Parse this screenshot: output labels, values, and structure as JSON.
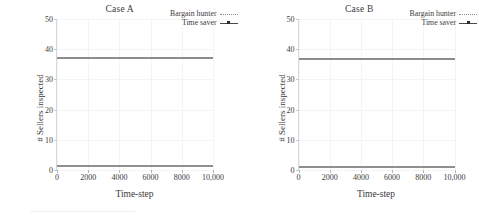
{
  "chart_data": [
    {
      "type": "line",
      "title": "Case A",
      "xlabel": "Time-step",
      "ylabel": "# Sellers inspected",
      "xlim": [
        0,
        10000
      ],
      "ylim": [
        0,
        50
      ],
      "xticks": [
        "0",
        "2000",
        "4000",
        "6000",
        "8000",
        "10,000"
      ],
      "xtick_values": [
        0,
        2000,
        4000,
        6000,
        8000,
        10000
      ],
      "yticks": [
        "0",
        "10",
        "20",
        "30",
        "40",
        "50"
      ],
      "ytick_values": [
        0,
        10,
        20,
        30,
        40,
        50
      ],
      "grid": true,
      "legend_position": "upper right",
      "x": [
        0,
        2000,
        4000,
        6000,
        8000,
        10000
      ],
      "series": [
        {
          "name": "Bargain hunter",
          "style": "dotted",
          "color": "#8f8f8f",
          "values": [
            1.5,
            1.5,
            1.5,
            1.5,
            1.5,
            1.5
          ]
        },
        {
          "name": "Time saver",
          "style": "solid-marker",
          "color": "#8c8c8c",
          "values": [
            37.5,
            37.5,
            37.5,
            37.5,
            37.5,
            37.5
          ]
        }
      ]
    },
    {
      "type": "line",
      "title": "Case B",
      "xlabel": "Time-step",
      "ylabel": "# Sellers inspected",
      "xlim": [
        0,
        10000
      ],
      "ylim": [
        0,
        50
      ],
      "xticks": [
        "0",
        "2000",
        "4000",
        "6000",
        "8000",
        "10,000"
      ],
      "xtick_values": [
        0,
        2000,
        4000,
        6000,
        8000,
        10000
      ],
      "yticks": [
        "0",
        "10",
        "20",
        "30",
        "40",
        "50"
      ],
      "ytick_values": [
        0,
        10,
        20,
        30,
        40,
        50
      ],
      "grid": true,
      "legend_position": "upper right",
      "x": [
        0,
        2000,
        4000,
        6000,
        8000,
        10000
      ],
      "series": [
        {
          "name": "Bargain hunter",
          "style": "dotted",
          "color": "#8f8f8f",
          "values": [
            1.4,
            1.4,
            1.4,
            1.4,
            1.4,
            1.4
          ]
        },
        {
          "name": "Time saver",
          "style": "solid-marker",
          "color": "#8c8c8c",
          "values": [
            37.0,
            37.0,
            37.0,
            37.0,
            37.0,
            37.0
          ]
        }
      ]
    }
  ]
}
